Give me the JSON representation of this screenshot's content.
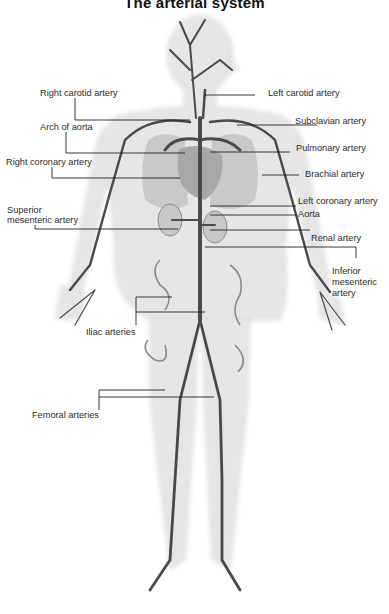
{
  "title": "The arterial system",
  "labels": {
    "right_carotid": "Right carotid artery",
    "arch_of_aorta": "Arch of aorta",
    "right_coronary": "Right coronary artery",
    "superior_mesenteric_1": "Superior",
    "superior_mesenteric_2": "mesenteric artery",
    "iliac": "Iliac arteries",
    "femoral": "Femoral arteries",
    "left_carotid": "Left carotid artery",
    "subclavian": "Subclavian artery",
    "pulmonary": "Pulmonary artery",
    "brachial": "Brachial artery",
    "left_coronary": "Left coronary artery",
    "aorta": "Aorta",
    "renal": "Renal artery",
    "inferior_mesenteric_1": "Inferior",
    "inferior_mesenteric_2": "mesenteric",
    "inferior_mesenteric_3": "artery"
  },
  "colors": {
    "body_fill": "#e8e8e8",
    "body_edge": "#d2d2d2",
    "artery": "#4a4a4a",
    "organ": "#bdbdbd",
    "leader_line": "#222222"
  }
}
